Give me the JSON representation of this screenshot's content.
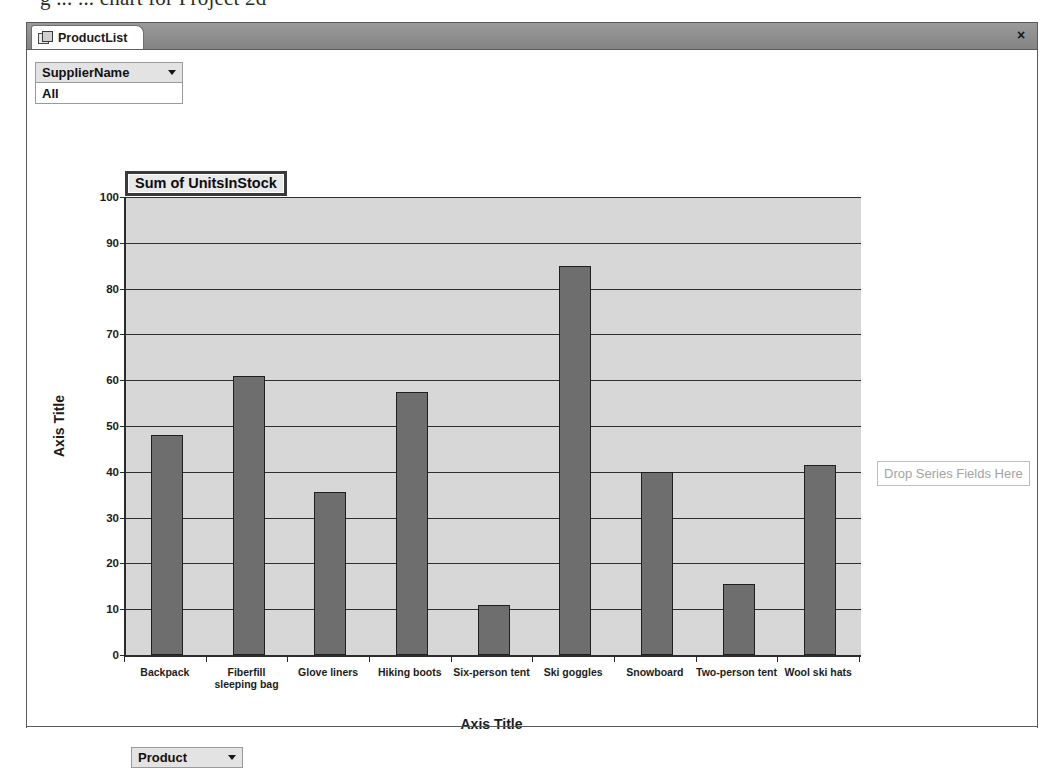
{
  "page_heading": "g           ...  ... chart for Project 2d",
  "window": {
    "tab": {
      "label": "ProductList",
      "icon": "form-datasheet-icon"
    },
    "close_label": "×"
  },
  "filter_field": {
    "name": "SupplierName",
    "value": "All",
    "caret": "chevron-down-icon"
  },
  "category_field": {
    "name": "Product",
    "caret": "chevron-down-icon"
  },
  "series_drop_zone": {
    "label": "Drop Series Fields Here"
  },
  "chart_data": {
    "type": "bar",
    "title": "Sum of UnitsInStock",
    "xlabel": "Axis Title",
    "ylabel": "Axis Title",
    "ylim": [
      0,
      100
    ],
    "ytick_step": 10,
    "yticks": [
      0,
      10,
      20,
      30,
      40,
      50,
      60,
      70,
      80,
      90,
      100
    ],
    "grid": true,
    "legend": false,
    "legend_position": "none",
    "bar_color": "#6e6e6e",
    "bar_border_color": "#1f1f1f",
    "plot_background": "#d7d7d7",
    "categories": [
      "Backpack",
      "Fiberfill sleeping bag",
      "Glove liners",
      "Hiking boots",
      "Six-person tent",
      "Ski goggles",
      "Snowboard",
      "Two-person tent",
      "Wool ski hats"
    ],
    "values": [
      48,
      61,
      35.5,
      57.5,
      11,
      85,
      40,
      15.5,
      41.5
    ]
  }
}
